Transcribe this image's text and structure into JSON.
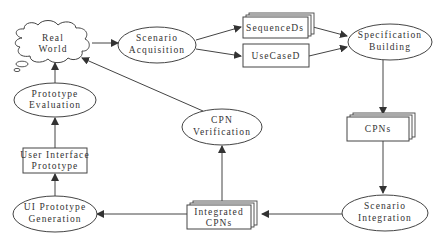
{
  "diagram": {
    "type": "process-flow",
    "nodes": {
      "real_world": {
        "line1": "Real",
        "line2": "World",
        "shape": "cloud"
      },
      "scenario_acquisition": {
        "line1": "Scenario",
        "line2": "Acquisition",
        "shape": "ellipse"
      },
      "sequence_ds": {
        "label": "SequenceDs",
        "shape": "stacked-document"
      },
      "use_case_d": {
        "label": "UseCaseD",
        "shape": "rectangle"
      },
      "specification_building": {
        "line1": "Specification",
        "line2": "Building",
        "shape": "ellipse"
      },
      "cpns": {
        "label": "CPNs",
        "shape": "stacked-document"
      },
      "scenario_integration": {
        "line1": "Scenario",
        "line2": "Integration",
        "shape": "ellipse"
      },
      "integrated_cpns": {
        "line1": "Integrated",
        "line2": "CPNs",
        "shape": "stacked-document"
      },
      "cpn_verification": {
        "line1": "CPN",
        "line2": "Verification",
        "shape": "ellipse"
      },
      "ui_prototype_generation": {
        "line1": "UI Prototype",
        "line2": "Generation",
        "shape": "ellipse"
      },
      "user_interface_prototype": {
        "line1": "User Interface",
        "line2": "Prototype",
        "shape": "rectangle"
      },
      "prototype_evaluation": {
        "line1": "Prototype",
        "line2": "Evaluation",
        "shape": "ellipse"
      }
    },
    "edges": [
      {
        "from": "Real World",
        "to": "Scenario Acquisition"
      },
      {
        "from": "Scenario Acquisition",
        "to": "SequenceDs"
      },
      {
        "from": "Scenario Acquisition",
        "to": "UseCaseD"
      },
      {
        "from": "SequenceDs",
        "to": "Specification Building"
      },
      {
        "from": "UseCaseD",
        "to": "Specification Building"
      },
      {
        "from": "Specification Building",
        "to": "CPNs"
      },
      {
        "from": "CPNs",
        "to": "Scenario Integration"
      },
      {
        "from": "Scenario Integration",
        "to": "Integrated CPNs"
      },
      {
        "from": "Integrated CPNs",
        "to": "CPN Verification"
      },
      {
        "from": "CPN Verification",
        "to": "Real World"
      },
      {
        "from": "Integrated CPNs",
        "to": "UI Prototype Generation"
      },
      {
        "from": "UI Prototype Generation",
        "to": "User Interface Prototype"
      },
      {
        "from": "User Interface Prototype",
        "to": "Prototype Evaluation"
      },
      {
        "from": "Prototype Evaluation",
        "to": "Real World"
      }
    ],
    "colors": {
      "stroke": "#333333",
      "fill": "#ffffff",
      "text": "#333333"
    }
  }
}
